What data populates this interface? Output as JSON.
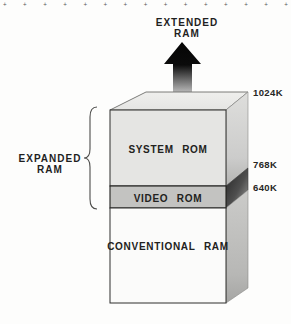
{
  "page": {
    "background": "#fdfdfc",
    "edge_marks": {
      "symbol": "+",
      "count": 15
    }
  },
  "extended_ram": {
    "line1": "EXTENDED",
    "line2": "RAM"
  },
  "expanded_ram": {
    "line1": "EXPANDED",
    "line2": "RAM"
  },
  "memory_box": {
    "sections": [
      {
        "label": "SYSTEM ROM"
      },
      {
        "label": "VIDEO ROM"
      },
      {
        "label": "CONVENTIONAL RAM"
      }
    ]
  },
  "capacity_markers": [
    {
      "text": "1024K"
    },
    {
      "text": "768K"
    },
    {
      "text": "640K"
    }
  ],
  "colors": {
    "ink": "#1f1f1f",
    "system_rom_face": "#e5e5e3",
    "video_rom_face": "#c3c3c1",
    "conventional_ram_face": "#fbfbfa",
    "top_face": "#eaeae8",
    "side_face_light": "#d8d8d6",
    "side_face_dark": "#2e2e2e",
    "arrow": "#0b0b0b"
  }
}
